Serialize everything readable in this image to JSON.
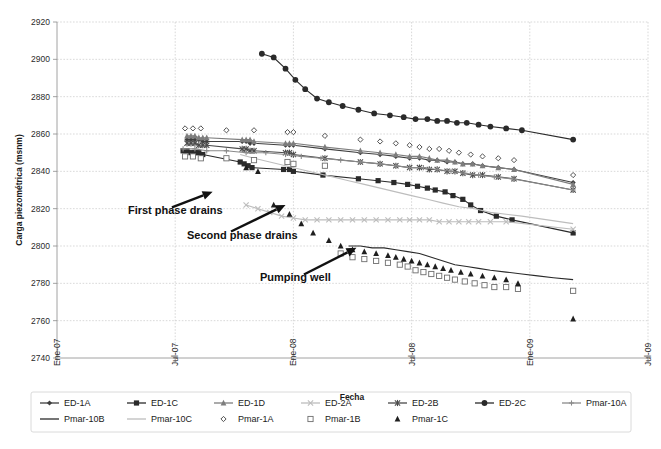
{
  "chart_data": {
    "type": "line",
    "title": "",
    "xlabel": "Fecha",
    "ylabel": "Carga piezométrica (msnm)",
    "ylim": [
      2740,
      2920
    ],
    "ytick_labels": [
      "2740",
      "2760",
      "2780",
      "2800",
      "2820",
      "2840",
      "2860",
      "2880",
      "2900",
      "2920"
    ],
    "ytick_values": [
      2740,
      2760,
      2780,
      2800,
      2820,
      2840,
      2860,
      2880,
      2900,
      2920
    ],
    "xtick_labels": [
      "Ene-07",
      "Jul-07",
      "Ene-08",
      "Jul-08",
      "Ene-09",
      "Jul-09"
    ],
    "xtick_values": [
      0,
      6,
      12,
      18,
      24,
      30
    ],
    "xlim": [
      0,
      30
    ],
    "grid": "horizontal-and-vertical-dotted",
    "legend_position": "bottom",
    "annotations": [
      {
        "text": "First phase drains",
        "x": 7.9,
        "y": 2829,
        "label_x": 3.6,
        "label_y": 2817
      },
      {
        "text": "Second phase drains",
        "x": 11.6,
        "y": 2822,
        "label_x": 6.6,
        "label_y": 2804
      },
      {
        "text": "Pumping well",
        "x": 15.2,
        "y": 2799,
        "label_x": 10.3,
        "label_y": 2781
      }
    ],
    "series": [
      {
        "name": "ED-1A",
        "marker": "diamond-filled",
        "color": "#3f3f3f",
        "line": true,
        "x": [
          6.6,
          6.8,
          7.0,
          7.2,
          7.4,
          7.6,
          9.4,
          9.6,
          9.8,
          10.0,
          11.6,
          11.8,
          12.0,
          13.6,
          15.4,
          16.4,
          17.2,
          17.9,
          18.4,
          18.9,
          19.3,
          19.8,
          20.2,
          20.6,
          21.1,
          21.6,
          22.4,
          23.2,
          26.2
        ],
        "y": [
          2857,
          2857,
          2857,
          2857,
          2856,
          2856,
          2856,
          2856,
          2855,
          2855,
          2854,
          2854,
          2854,
          2852,
          2850,
          2849,
          2848,
          2847,
          2847,
          2846,
          2846,
          2845,
          2845,
          2844,
          2844,
          2843,
          2842,
          2841,
          2834
        ]
      },
      {
        "name": "ED-1C",
        "marker": "square-filled",
        "color": "#2a2a2a",
        "line": true,
        "x": [
          6.4,
          6.6,
          6.8,
          7.0,
          7.2,
          7.4,
          9.3,
          9.5,
          9.7,
          9.9,
          11.5,
          11.8,
          12.0,
          13.5,
          15.3,
          16.3,
          17.1,
          17.8,
          18.3,
          18.8,
          19.2,
          19.7,
          20.1,
          20.6,
          21.0,
          21.5,
          22.3,
          23.1,
          26.2
        ],
        "y": [
          2851,
          2851,
          2850,
          2850,
          2850,
          2849,
          2845,
          2844,
          2843,
          2842,
          2841,
          2841,
          2840,
          2838,
          2836,
          2835,
          2834,
          2833,
          2832,
          2831,
          2830,
          2829,
          2827,
          2825,
          2822,
          2819,
          2816,
          2814,
          2807
        ]
      },
      {
        "name": "ED-1D",
        "marker": "triangle-filled",
        "color": "#7d7d7d",
        "line": true,
        "x": [
          6.6,
          6.8,
          7.0,
          7.2,
          7.4,
          7.6,
          9.4,
          9.6,
          9.8,
          10.0,
          11.6,
          11.8,
          12.0,
          13.6,
          15.4,
          16.4,
          17.2,
          17.9,
          18.4,
          18.9,
          19.3,
          19.8,
          20.2,
          20.6,
          21.1,
          21.6,
          22.4,
          23.2,
          26.2
        ],
        "y": [
          2859,
          2859,
          2859,
          2858,
          2858,
          2858,
          2857,
          2857,
          2857,
          2856,
          2855,
          2855,
          2855,
          2853,
          2851,
          2850,
          2849,
          2848,
          2848,
          2847,
          2846,
          2846,
          2845,
          2844,
          2844,
          2843,
          2842,
          2841,
          2833
        ]
      },
      {
        "name": "ED-2A",
        "marker": "x-cross",
        "color": "#bdbdbd",
        "line": true,
        "x": [
          9.6,
          10.2,
          10.8,
          11.4,
          12.0,
          12.6,
          13.2,
          13.8,
          14.4,
          15.0,
          15.6,
          16.2,
          16.8,
          17.4,
          17.9,
          18.4,
          18.9,
          19.4,
          19.9,
          20.4,
          20.9,
          21.4,
          22.0,
          22.8,
          26.2
        ],
        "y": [
          2822,
          2820,
          2818,
          2816,
          2815,
          2814,
          2814,
          2814,
          2814,
          2814,
          2814,
          2814,
          2814,
          2814,
          2814,
          2814,
          2814,
          2813,
          2813,
          2813,
          2813,
          2813,
          2813,
          2813,
          2809
        ]
      },
      {
        "name": "ED-2B",
        "marker": "asterisk",
        "color": "#4a4a4a",
        "line": true,
        "x": [
          6.6,
          6.8,
          7.0,
          7.2,
          7.4,
          7.6,
          9.4,
          9.6,
          9.8,
          10.0,
          11.6,
          11.8,
          12.0,
          13.6,
          15.4,
          16.4,
          17.2,
          17.9,
          18.4,
          18.9,
          19.3,
          19.8,
          20.2,
          20.6,
          21.1,
          21.6,
          22.4,
          23.2,
          26.2
        ],
        "y": [
          2855,
          2855,
          2855,
          2854,
          2854,
          2854,
          2852,
          2852,
          2851,
          2851,
          2850,
          2850,
          2849,
          2847,
          2845,
          2844,
          2843,
          2842,
          2842,
          2841,
          2841,
          2840,
          2840,
          2839,
          2838,
          2838,
          2837,
          2836,
          2830
        ]
      },
      {
        "name": "ED-2C",
        "marker": "circle-filled",
        "color": "#2a2a2a",
        "line": true,
        "x": [
          10.4,
          11.0,
          11.6,
          12.1,
          12.6,
          13.2,
          13.8,
          14.5,
          15.3,
          16.1,
          16.9,
          17.6,
          18.2,
          18.8,
          19.3,
          19.8,
          20.3,
          20.8,
          21.4,
          22.0,
          22.8,
          23.6,
          26.2
        ],
        "y": [
          2903,
          2901,
          2895,
          2889,
          2884,
          2879,
          2877,
          2875,
          2873,
          2871,
          2870,
          2869,
          2868,
          2868,
          2867,
          2867,
          2866,
          2866,
          2865,
          2864,
          2863,
          2862,
          2857
        ]
      },
      {
        "name": "Pmar-10A",
        "marker": "plus",
        "color": "#8a8a8a",
        "line": true,
        "x": [
          6.4,
          7.0,
          7.6,
          8.6,
          9.6,
          10.6,
          11.6,
          12.4,
          13.4,
          14.4,
          15.4,
          16.4,
          17.2,
          17.9,
          18.6,
          19.3,
          20.0,
          20.7,
          21.4,
          22.2,
          23.1,
          26.2
        ],
        "y": [
          2852,
          2852,
          2851,
          2851,
          2850,
          2850,
          2849,
          2848,
          2847,
          2846,
          2845,
          2844,
          2843,
          2842,
          2842,
          2841,
          2840,
          2839,
          2838,
          2837,
          2836,
          2830
        ]
      },
      {
        "name": "Pmar-10B",
        "marker": "none",
        "color": "#2a2a2a",
        "line": true,
        "x": [
          14.8,
          15.4,
          16.0,
          16.6,
          17.2,
          17.8,
          18.4,
          19.0,
          19.6,
          20.2,
          20.8,
          21.4,
          22.0,
          22.8,
          23.6,
          24.4,
          25.2,
          26.2
        ],
        "y": [
          2800,
          2800,
          2799,
          2799,
          2798,
          2797,
          2796,
          2794,
          2792,
          2790,
          2789,
          2788,
          2787,
          2786,
          2785,
          2784,
          2783,
          2782
        ]
      },
      {
        "name": "Pmar-10C",
        "marker": "none",
        "color": "#bdbdbd",
        "line": true,
        "x": [
          9.3,
          10.0,
          10.8,
          11.6,
          12.4,
          13.2,
          14.0,
          14.8,
          15.6,
          16.4,
          17.2,
          18.0,
          18.8,
          19.6,
          20.4,
          21.2,
          22.0,
          22.8,
          23.6,
          26.2
        ],
        "y": [
          2849,
          2847,
          2845,
          2843,
          2841,
          2839,
          2837,
          2835,
          2833,
          2831,
          2829,
          2827,
          2825,
          2823,
          2821,
          2820,
          2818,
          2817,
          2816,
          2812
        ]
      },
      {
        "name": "Pmar-1A",
        "marker": "diamond-open",
        "color": "#3f3f3f",
        "line": false,
        "x": [
          6.5,
          6.9,
          7.3,
          8.6,
          10.0,
          11.7,
          12.0,
          13.6,
          15.4,
          16.4,
          17.2,
          17.9,
          18.4,
          18.9,
          19.4,
          19.9,
          20.4,
          21.0,
          21.6,
          22.4,
          23.2,
          26.2
        ],
        "y": [
          2863,
          2863,
          2863,
          2862,
          2862,
          2861,
          2861,
          2859,
          2857,
          2856,
          2855,
          2854,
          2853,
          2852,
          2852,
          2851,
          2850,
          2849,
          2848,
          2847,
          2846,
          2838
        ]
      },
      {
        "name": "Pmar-1B",
        "marker": "square-open",
        "color": "#6e6e6e",
        "line": false,
        "x": [
          6.5,
          6.9,
          7.3,
          8.6,
          10.0,
          11.7,
          12.0,
          13.6,
          14.4,
          15.0,
          15.6,
          16.2,
          16.8,
          17.4,
          17.8,
          18.2,
          18.6,
          19.0,
          19.4,
          19.8,
          20.2,
          20.7,
          21.2,
          21.7,
          22.2,
          22.8,
          23.4,
          26.2
        ],
        "y": [
          2848,
          2848,
          2847,
          2847,
          2846,
          2845,
          2844,
          2843,
          2796,
          2794,
          2793,
          2792,
          2791,
          2790,
          2789,
          2787,
          2786,
          2785,
          2784,
          2783,
          2782,
          2781,
          2780,
          2779,
          2778,
          2778,
          2777,
          2776
        ]
      },
      {
        "name": "Pmar-1C",
        "marker": "triangle-filled",
        "color": "#1f1f1f",
        "line": false,
        "x": [
          9.6,
          10.2,
          11.0,
          11.8,
          12.4,
          13.0,
          13.8,
          14.4,
          15.0,
          15.6,
          16.2,
          16.8,
          17.2,
          17.6,
          18.0,
          18.4,
          18.8,
          19.2,
          19.6,
          20.0,
          20.5,
          21.0,
          21.6,
          22.2,
          22.8,
          23.4,
          26.2
        ],
        "y": [
          2842,
          2840,
          2822,
          2817,
          2812,
          2807,
          2803,
          2800,
          2798,
          2797,
          2796,
          2795,
          2794,
          2793,
          2792,
          2791,
          2790,
          2789,
          2788,
          2787,
          2786,
          2785,
          2784,
          2783,
          2782,
          2780,
          2761
        ]
      }
    ]
  },
  "legend": {
    "items": [
      {
        "label": "ED-1A",
        "marker": "diamond-filled",
        "color": "#3f3f3f",
        "line": true
      },
      {
        "label": "ED-1C",
        "marker": "square-filled",
        "color": "#2a2a2a",
        "line": true
      },
      {
        "label": "ED-1D",
        "marker": "triangle-filled",
        "color": "#7d7d7d",
        "line": true
      },
      {
        "label": "ED-2A",
        "marker": "x-cross",
        "color": "#bdbdbd",
        "line": true
      },
      {
        "label": "ED-2B",
        "marker": "asterisk",
        "color": "#4a4a4a",
        "line": true
      },
      {
        "label": "ED-2C",
        "marker": "circle-filled",
        "color": "#2a2a2a",
        "line": true
      },
      {
        "label": "Pmar-10A",
        "marker": "plus",
        "color": "#8a8a8a",
        "line": true
      },
      {
        "label": "Pmar-10B",
        "marker": "none",
        "color": "#2a2a2a",
        "line": true
      },
      {
        "label": "Pmar-10C",
        "marker": "none",
        "color": "#bdbdbd",
        "line": true
      },
      {
        "label": "Pmar-1A",
        "marker": "diamond-open",
        "color": "#3f3f3f",
        "line": false
      },
      {
        "label": "Pmar-1B",
        "marker": "square-open",
        "color": "#6e6e6e",
        "line": false
      },
      {
        "label": "Pmar-1C",
        "marker": "triangle-filled",
        "color": "#1f1f1f",
        "line": false
      }
    ]
  }
}
